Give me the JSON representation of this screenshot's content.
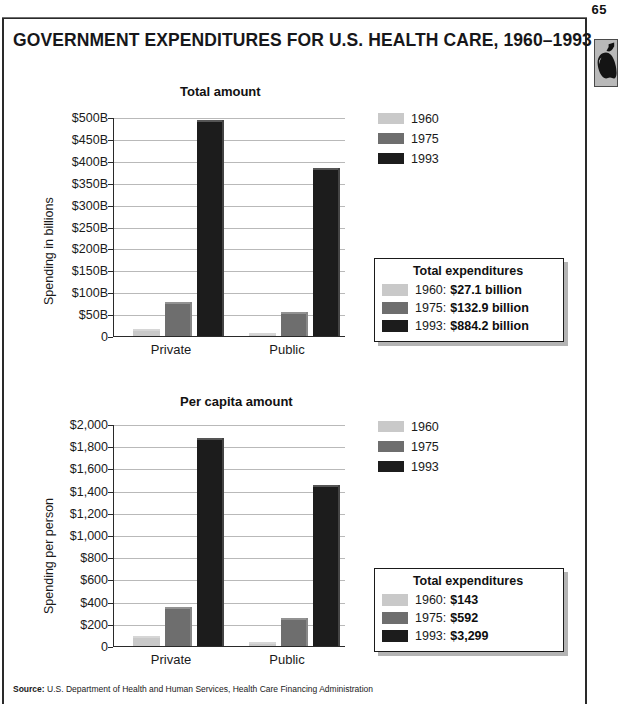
{
  "page": {
    "number": "65",
    "title": "GOVERNMENT EXPENDITURES FOR U.S. HEALTH CARE, 1960–1993",
    "apple_icon": "apple-icon",
    "source_label": "Source:",
    "source_text": "U.S. Department of Health and Human Services, Health Care Financing Administration"
  },
  "colors": {
    "series_1960": "#c9c9c9",
    "series_1975": "#6e6e6e",
    "series_1993": "#1c1c1c",
    "gridline": "#b9b9b9",
    "axis": "#2a2a2a",
    "text": "#1a1a1a",
    "infobox_shadow": "#b4b4b4",
    "badge_bg": "#b9b9b9"
  },
  "chart_data": [
    {
      "id": "total-amount",
      "type": "bar",
      "title": "Total amount",
      "xlabel": "",
      "ylabel": "Spending in billions",
      "categories": [
        "Private",
        "Public"
      ],
      "series": [
        {
          "name": "1960",
          "color": "#c9c9c9",
          "values": [
            17,
            6
          ]
        },
        {
          "name": "1975",
          "color": "#6e6e6e",
          "values": [
            78,
            55
          ]
        },
        {
          "name": "1993",
          "color": "#1c1c1c",
          "values": [
            494,
            383
          ]
        }
      ],
      "ylim": [
        0,
        500
      ],
      "ytick_values": [
        0,
        50,
        100,
        150,
        200,
        250,
        300,
        350,
        400,
        450,
        500
      ],
      "ytick_labels": [
        "0",
        "$50B",
        "$100B",
        "$150B",
        "$200B",
        "$250B",
        "$300B",
        "$350B",
        "$400B",
        "$450B",
        "$500B"
      ],
      "grid": true,
      "legend_position": "right",
      "legend": [
        "1960",
        "1975",
        "1993"
      ],
      "infobox": {
        "title": "Total expenditures",
        "rows": [
          {
            "year": "1960:",
            "value": "$27.1 billion",
            "color": "#c9c9c9"
          },
          {
            "year": "1975:",
            "value": "$132.9 billion",
            "color": "#6e6e6e"
          },
          {
            "year": "1993:",
            "value": "$884.2 billion",
            "color": "#1c1c1c"
          }
        ]
      }
    },
    {
      "id": "per-capita-amount",
      "type": "bar",
      "title": "Per capita amount",
      "xlabel": "",
      "ylabel": "Spending per person",
      "categories": [
        "Private",
        "Public"
      ],
      "series": [
        {
          "name": "1960",
          "color": "#c9c9c9",
          "values": [
            90,
            40
          ]
        },
        {
          "name": "1975",
          "color": "#6e6e6e",
          "values": [
            355,
            250
          ]
        },
        {
          "name": "1993",
          "color": "#1c1c1c",
          "values": [
            1870,
            1455
          ]
        }
      ],
      "ylim": [
        0,
        2000
      ],
      "ytick_values": [
        0,
        200,
        400,
        600,
        800,
        1000,
        1200,
        1400,
        1600,
        1800,
        2000
      ],
      "ytick_labels": [
        "0",
        "$200",
        "$400",
        "$600",
        "$800",
        "$1,000",
        "$1,200",
        "$1,400",
        "$1,600",
        "$1,800",
        "$2,000"
      ],
      "grid": true,
      "legend_position": "right",
      "legend": [
        "1960",
        "1975",
        "1993"
      ],
      "infobox": {
        "title": "Total expenditures",
        "rows": [
          {
            "year": "1960:",
            "value": "$143",
            "color": "#c9c9c9"
          },
          {
            "year": "1975:",
            "value": "$592",
            "color": "#6e6e6e"
          },
          {
            "year": "1993:",
            "value": "$3,299",
            "color": "#1c1c1c"
          }
        ]
      }
    }
  ],
  "layout": {
    "chart1": {
      "top": 80,
      "plot_left": 113,
      "plot_top": 118,
      "plot_w": 232,
      "plot_h": 219,
      "title_left": 180,
      "title_top": 84,
      "ylabel_left": 42,
      "ylabel_top": 305,
      "legend_left": 378,
      "legend_top": 110,
      "infobox_left": 374,
      "infobox_top": 258,
      "infobox_w": 190
    },
    "chart2": {
      "top": 390,
      "plot_left": 113,
      "plot_top": 425,
      "plot_w": 232,
      "plot_h": 222,
      "title_left": 180,
      "title_top": 394,
      "ylabel_left": 42,
      "ylabel_top": 614,
      "legend_left": 378,
      "legend_top": 418,
      "infobox_left": 374,
      "infobox_top": 568,
      "infobox_w": 190
    }
  }
}
